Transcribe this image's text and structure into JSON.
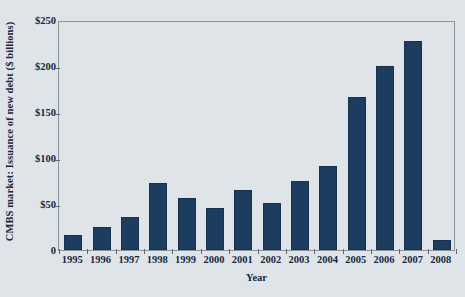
{
  "chart_data": {
    "type": "bar",
    "title": "",
    "xlabel": "Year",
    "ylabel": "CMBS market: Issuance of new debt ($ billions)",
    "categories": [
      "1995",
      "1996",
      "1997",
      "1998",
      "1999",
      "2000",
      "2001",
      "2002",
      "2003",
      "2004",
      "2005",
      "2006",
      "2007",
      "2008"
    ],
    "values": [
      16,
      25,
      36,
      73,
      56,
      46,
      65,
      51,
      75,
      91,
      166,
      200,
      227,
      11
    ],
    "ylim": [
      0,
      250
    ],
    "yticks": [
      0,
      50,
      100,
      150,
      200,
      250
    ],
    "ytick_labels": [
      "0",
      "$50",
      "$100",
      "$150",
      "$200",
      "$250"
    ],
    "grid": false,
    "legend": false,
    "bar_color": "#1c3c60",
    "background_color": "#dfe4e9",
    "axis_color": "#8b939b",
    "text_color": "#16283c"
  }
}
